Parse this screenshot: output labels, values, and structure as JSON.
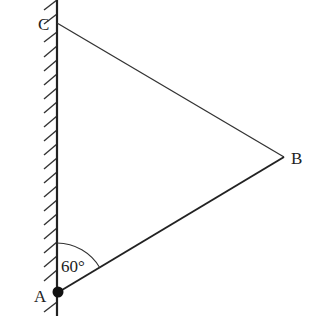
{
  "diagram": {
    "type": "geometry",
    "points": {
      "A": {
        "label": "A",
        "x": 57,
        "y": 293
      },
      "B": {
        "label": "B",
        "x": 284,
        "y": 157
      },
      "C": {
        "label": "C",
        "x": 57,
        "y": 23
      }
    },
    "segments": [
      "CB",
      "AB",
      "AC (wall)"
    ],
    "angle": {
      "vertex": "A",
      "label": "60°",
      "between": [
        "AC",
        "AB"
      ]
    },
    "wall": {
      "side": "left",
      "hatched": true
    },
    "colors": {
      "line": "#222222",
      "background": "#ffffff"
    }
  }
}
